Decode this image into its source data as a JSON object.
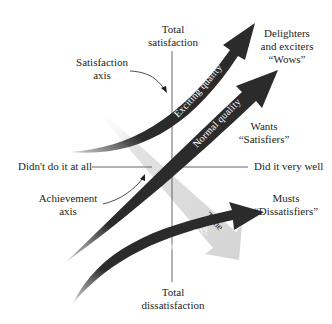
{
  "diagram": {
    "axes": {
      "vertical": {
        "name": "Satisfaction axis",
        "top_label": [
          "Total",
          "satisfaction"
        ],
        "bottom_label": [
          "Total",
          "dissatisfaction"
        ]
      },
      "horizontal": {
        "name": "Achievement axis",
        "left_label": "Didn't do it at all",
        "right_label": "Did it very well"
      }
    },
    "callouts": {
      "satisfaction_axis": [
        "Satisfaction",
        "axis"
      ],
      "achievement_axis": [
        "Achievement",
        "axis"
      ]
    },
    "curves": [
      {
        "name": "Exciting quality",
        "outcome": [
          "Delighters",
          "and exciters",
          "“Wows”"
        ],
        "color": "#2b2b2b"
      },
      {
        "name": "Normal quality",
        "outcome": [
          "Wants",
          "“Satisfiers”"
        ],
        "color": "#2b2b2b"
      },
      {
        "name": "Expected quality",
        "outcome": [
          "Musts",
          "“Dissatisfiers”"
        ],
        "color": "#2b2b2b"
      }
    ],
    "time_arrow": {
      "label": "Time",
      "color": "#d9d9d9"
    },
    "colors": {
      "axis_line": "#555555",
      "curve_fill": "#2b2b2b",
      "time_fill": "#d6d6d6",
      "text": "#231f20"
    }
  }
}
